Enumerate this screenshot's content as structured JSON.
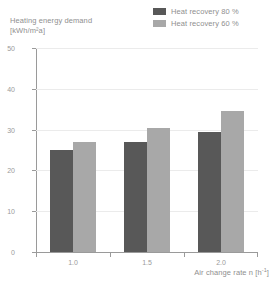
{
  "chart_data": {
    "type": "bar",
    "title": "Heating energy demand [kWh/m²a]",
    "title_line1": "Heating energy demand",
    "title_line2": "[kWh/m²a]",
    "xlabel": "Air change rate n [h⁻¹]",
    "ylabel": "Heating energy demand [kWh/m²a]",
    "categories": [
      "1.0",
      "1.5",
      "2.0"
    ],
    "series": [
      {
        "name": "Heat recovery 80 %",
        "color": "#585858",
        "values": [
          25,
          27,
          29.5
        ]
      },
      {
        "name": "Heat recovery 60 %",
        "color": "#a8a8a8",
        "values": [
          27,
          30.5,
          34.5
        ]
      }
    ],
    "ylim": [
      0,
      50
    ],
    "yticks": [
      0,
      10,
      20,
      30,
      40,
      50
    ],
    "ytick_labels": [
      "0",
      "10",
      "20",
      "30",
      "40",
      "50"
    ],
    "grid": true,
    "legend_position": "top-right"
  },
  "legend": {
    "items": [
      {
        "label": "Heat recovery 80 %",
        "color": "#585858"
      },
      {
        "label": "Heat recovery 60 %",
        "color": "#a8a8a8"
      }
    ]
  },
  "axes": {
    "x": {
      "label": "Air change rate n [h⁻¹]",
      "label_text": "Air change rate n [h",
      "label_sup": "-1",
      "label_tail": "]",
      "ticks": [
        "1.0",
        "1.5",
        "2.0"
      ]
    },
    "y": {
      "title_line1": "Heating energy demand",
      "title_line2": "[kWh/m²a]",
      "ticks": [
        "50",
        "40",
        "30",
        "20",
        "10",
        "0"
      ]
    }
  }
}
